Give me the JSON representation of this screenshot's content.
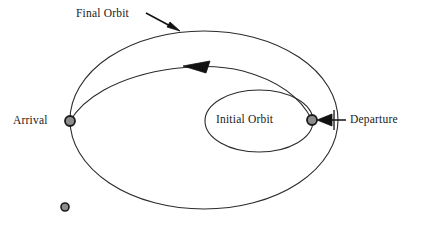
{
  "diagram": {
    "labels": {
      "final_orbit": "Final Orbit",
      "arrival": "Arrival",
      "initial_orbit": "Initial Orbit",
      "departure": "Departure"
    },
    "colors": {
      "stroke": "#2b2b2b",
      "text": "#1a1a1a",
      "marker_fill": "#8c8c8c",
      "marker_stroke": "#1a1a1a",
      "background": "#ffffff"
    },
    "markers": {
      "arrival_point": {
        "x": 70,
        "y": 121,
        "r": 5
      },
      "departure_point": {
        "x": 312,
        "y": 120,
        "r": 5
      },
      "central_body": {
        "x": 65,
        "y": 207,
        "r": 4
      }
    },
    "orbits": {
      "final_orbit": {
        "cx": 204,
        "cy": 120,
        "rx": 134,
        "ry": 89
      },
      "initial_orbit": {
        "cx": 259,
        "cy": 121,
        "rx": 54,
        "ry": 31
      },
      "transfer_arc": {
        "from": "Departure",
        "to": "Arrival",
        "direction": "counterclockwise"
      }
    },
    "annotations": {
      "final_orbit_pointer": {
        "from_x": 146,
        "from_y": 13,
        "to_x": 178,
        "to_y": 30
      },
      "departure_pointer": {
        "from_x": 346,
        "from_y": 120,
        "to_x": 318,
        "to_y": 120
      },
      "transfer_direction_arrow": {
        "x": 196,
        "y": 67,
        "points": "left"
      }
    }
  }
}
